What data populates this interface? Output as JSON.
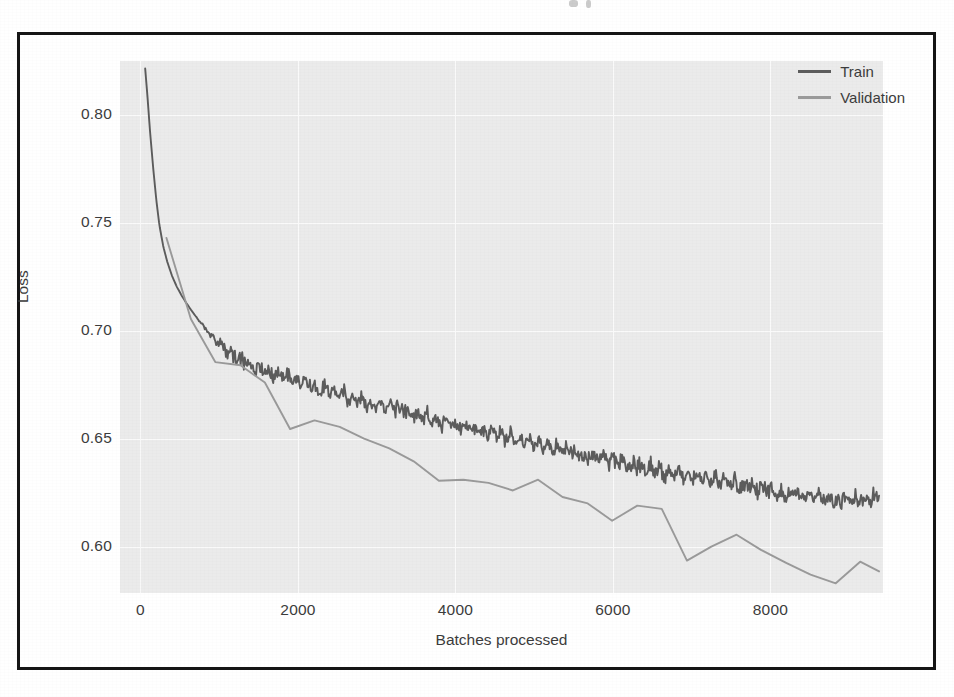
{
  "figure": {
    "frame_border_color": "#151515",
    "plot_background": "#ebebeb",
    "gridline_color": "#fafafa",
    "page_background": "#ffffff"
  },
  "legend": {
    "position": "top-right",
    "entries": [
      {
        "label": "Train",
        "color": "#5c5c5c"
      },
      {
        "label": "Validation",
        "color": "#9a9a9a"
      }
    ]
  },
  "axes": {
    "x": {
      "title": "Batches processed",
      "ticks": [
        0,
        2000,
        4000,
        6000,
        8000
      ],
      "tick_labels": [
        "0",
        "2000",
        "4000",
        "6000",
        "8000"
      ],
      "min": -260,
      "max": 9430
    },
    "y": {
      "title": "Loss",
      "ticks": [
        0.6,
        0.65,
        0.7,
        0.75,
        0.8
      ],
      "tick_labels": [
        "0.60",
        "0.65",
        "0.70",
        "0.75",
        "0.80"
      ],
      "min": 0.5785,
      "max": 0.825
    }
  },
  "chart_data": {
    "type": "line",
    "title": "",
    "xlabel": "Batches processed",
    "ylabel": "Loss",
    "xlim": [
      -260,
      9430
    ],
    "ylim": [
      0.5785,
      0.825
    ],
    "grid": true,
    "legend_position": "top-right",
    "series": [
      {
        "name": "Train",
        "color": "#5c5c5c",
        "noise_amplitude": 0.0045,
        "x": [
          60,
          90,
          120,
          160,
          200,
          240,
          290,
          340,
          400,
          460,
          520,
          580,
          640,
          700,
          760,
          820,
          880,
          940,
          1000,
          1100,
          1200,
          1300,
          1400,
          1500,
          1600,
          1700,
          1800,
          1900,
          2000,
          2100,
          2200,
          2300,
          2400,
          2500,
          2600,
          2700,
          2800,
          2900,
          3000,
          3200,
          3400,
          3600,
          3800,
          4000,
          4200,
          4400,
          4600,
          4800,
          5000,
          5200,
          5400,
          5600,
          5800,
          6000,
          6200,
          6400,
          6600,
          6800,
          7000,
          7200,
          7400,
          7600,
          7800,
          8000,
          8200,
          8400,
          8600,
          8800,
          9000,
          9200,
          9380
        ],
        "y": [
          0.8215,
          0.808,
          0.793,
          0.776,
          0.761,
          0.749,
          0.739,
          0.732,
          0.7255,
          0.7205,
          0.7165,
          0.713,
          0.7098,
          0.7068,
          0.704,
          0.7012,
          0.6985,
          0.6962,
          0.694,
          0.6905,
          0.6878,
          0.6858,
          0.6842,
          0.6828,
          0.6815,
          0.6802,
          0.679,
          0.6778,
          0.6766,
          0.6754,
          0.6743,
          0.6732,
          0.6721,
          0.671,
          0.67,
          0.669,
          0.668,
          0.667,
          0.666,
          0.664,
          0.6621,
          0.6602,
          0.6583,
          0.6565,
          0.6547,
          0.6529,
          0.6512,
          0.6495,
          0.6478,
          0.6461,
          0.6444,
          0.6428,
          0.6412,
          0.6396,
          0.6381,
          0.6366,
          0.6351,
          0.6337,
          0.6323,
          0.6309,
          0.6296,
          0.6283,
          0.6271,
          0.6259,
          0.6248,
          0.6238,
          0.6229,
          0.6221,
          0.6215,
          0.6211,
          0.6228
        ]
      },
      {
        "name": "Validation",
        "color": "#9a9a9a",
        "noise_amplitude": 0.0,
        "x": [
          330,
          640,
          950,
          1270,
          1580,
          1900,
          2210,
          2530,
          2840,
          3160,
          3470,
          3790,
          4100,
          4420,
          4730,
          5050,
          5360,
          5680,
          5990,
          6310,
          6620,
          6940,
          7250,
          7570,
          7880,
          8200,
          8510,
          8830,
          9140,
          9380
        ],
        "y": [
          0.743,
          0.7055,
          0.6855,
          0.684,
          0.676,
          0.6545,
          0.6585,
          0.6555,
          0.65,
          0.6455,
          0.6395,
          0.6305,
          0.631,
          0.6295,
          0.626,
          0.631,
          0.623,
          0.62,
          0.612,
          0.619,
          0.6175,
          0.5935,
          0.6,
          0.6055,
          0.5985,
          0.5925,
          0.587,
          0.583,
          0.593,
          0.5885
        ]
      }
    ]
  }
}
